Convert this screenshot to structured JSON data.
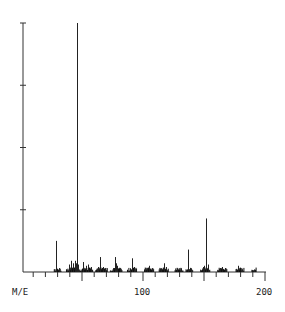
{
  "chart_data": {
    "type": "bar",
    "title": "",
    "xlabel": "M/E",
    "ylabel": "",
    "xlim": [
      0,
      200
    ],
    "ylim": [
      0,
      100
    ],
    "x_tick_labels": [
      "100",
      "200"
    ],
    "y_major_ticks": 4,
    "grid": false,
    "legend": null,
    "peaks": [
      {
        "mz": 29,
        "intensity": 12.5
      },
      {
        "mz": 31,
        "intensity": 1.5
      },
      {
        "mz": 39,
        "intensity": 3.0
      },
      {
        "mz": 41,
        "intensity": 4.5
      },
      {
        "mz": 43,
        "intensity": 3.5
      },
      {
        "mz": 44,
        "intensity": 4.5
      },
      {
        "mz": 45,
        "intensity": 3.5
      },
      {
        "mz": 46,
        "intensity": 100
      },
      {
        "mz": 47,
        "intensity": 3.0
      },
      {
        "mz": 51,
        "intensity": 4.0
      },
      {
        "mz": 53,
        "intensity": 2.5
      },
      {
        "mz": 55,
        "intensity": 3.0
      },
      {
        "mz": 57,
        "intensity": 2.0
      },
      {
        "mz": 63,
        "intensity": 2.0
      },
      {
        "mz": 65,
        "intensity": 6.0
      },
      {
        "mz": 67,
        "intensity": 2.0
      },
      {
        "mz": 69,
        "intensity": 1.5
      },
      {
        "mz": 75,
        "intensity": 1.5
      },
      {
        "mz": 77,
        "intensity": 6.0
      },
      {
        "mz": 78,
        "intensity": 3.5
      },
      {
        "mz": 79,
        "intensity": 2.5
      },
      {
        "mz": 81,
        "intensity": 1.5
      },
      {
        "mz": 89,
        "intensity": 1.5
      },
      {
        "mz": 91,
        "intensity": 5.5
      },
      {
        "mz": 93,
        "intensity": 2.0
      },
      {
        "mz": 103,
        "intensity": 1.5
      },
      {
        "mz": 105,
        "intensity": 2.5
      },
      {
        "mz": 107,
        "intensity": 1.5
      },
      {
        "mz": 115,
        "intensity": 1.5
      },
      {
        "mz": 117,
        "intensity": 3.5
      },
      {
        "mz": 119,
        "intensity": 2.0
      },
      {
        "mz": 128,
        "intensity": 1.5
      },
      {
        "mz": 131,
        "intensity": 1.5
      },
      {
        "mz": 137,
        "intensity": 9.0
      },
      {
        "mz": 139,
        "intensity": 1.5
      },
      {
        "mz": 149,
        "intensity": 2.0
      },
      {
        "mz": 150,
        "intensity": 2.5
      },
      {
        "mz": 152,
        "intensity": 21.5
      },
      {
        "mz": 153,
        "intensity": 3.0
      },
      {
        "mz": 163,
        "intensity": 1.5
      },
      {
        "mz": 165,
        "intensity": 2.0
      },
      {
        "mz": 167,
        "intensity": 1.5
      },
      {
        "mz": 178,
        "intensity": 2.5
      },
      {
        "mz": 181,
        "intensity": 1.0
      },
      {
        "mz": 191,
        "intensity": 1.0
      }
    ]
  },
  "labels": {
    "xlabel": "M/E",
    "tick_100": "100",
    "tick_200": "200"
  }
}
